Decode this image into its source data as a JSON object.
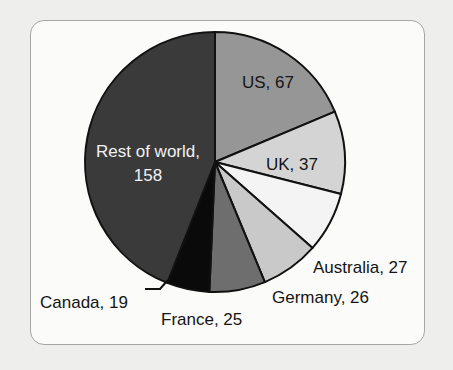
{
  "figure": {
    "background_color": "#eeeeec",
    "panel_color": "#fbfbfa",
    "border_color": "#a6a6a6"
  },
  "chart_data": {
    "type": "pie",
    "title": "",
    "subtitle": "",
    "xlabel": "",
    "ylabel": "",
    "total": 359,
    "start_angle_deg": 0,
    "direction": "clockwise",
    "legend_position": "none",
    "grid": false,
    "categories": [
      "US",
      "UK",
      "Australia",
      "Germany",
      "France",
      "Canada",
      "Rest of world"
    ],
    "values": [
      67,
      37,
      27,
      26,
      25,
      19,
      158
    ],
    "slices": [
      {
        "name": "US",
        "value": 67,
        "label": "US, 67",
        "color": "#969696",
        "label_color": "#151515",
        "label_placement": "inside",
        "label_x": 268,
        "label_y": 88
      },
      {
        "name": "UK",
        "value": 37,
        "label": "UK, 37",
        "color": "#d4d4d4",
        "label_color": "#151515",
        "label_placement": "inside",
        "label_x": 292,
        "label_y": 170
      },
      {
        "name": "Australia",
        "value": 27,
        "label": "Australia, 27",
        "color": "#f4f4f4",
        "label_color": "#141414",
        "label_placement": "outside",
        "label_x": 313,
        "label_y": 273
      },
      {
        "name": "Germany",
        "value": 26,
        "label": "Germany, 26",
        "color": "#c9c9c9",
        "label_color": "#141414",
        "label_placement": "outside",
        "label_x": 272,
        "label_y": 303
      },
      {
        "name": "France",
        "value": 25,
        "label": "France, 25",
        "color": "#6e6e6e",
        "label_color": "#141414",
        "label_placement": "outside",
        "label_x": 161,
        "label_y": 325
      },
      {
        "name": "Canada",
        "value": 19,
        "label": "Canada, 19",
        "color": "#0a0a0a",
        "label_color": "#141414",
        "label_placement": "outside-leader",
        "label_x": 40,
        "label_y": 308
      },
      {
        "name": "Rest of world",
        "value": 158,
        "label": "Rest of world,",
        "label_line2": "158",
        "color": "#3a3a3a",
        "label_color": "#f2f2f2",
        "label_placement": "inside",
        "label_x": 148,
        "label_y": 157
      }
    ]
  }
}
